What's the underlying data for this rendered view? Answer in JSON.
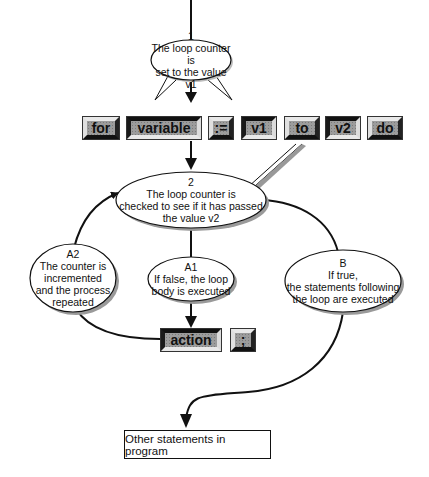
{
  "diagram": {
    "keywords": [
      {
        "id": "for",
        "label": "for",
        "style": "raised"
      },
      {
        "id": "variable",
        "label": "variable",
        "style": "sunken"
      },
      {
        "id": "assign",
        "label": ":=",
        "style": "raised"
      },
      {
        "id": "v1",
        "label": "v1",
        "style": "sunken"
      },
      {
        "id": "to",
        "label": "to",
        "style": "raised"
      },
      {
        "id": "v2",
        "label": "v2",
        "style": "sunken"
      },
      {
        "id": "do",
        "label": "do",
        "style": "raised"
      }
    ],
    "body_keywords": [
      {
        "id": "action",
        "label": "action",
        "style": "sunken"
      },
      {
        "id": "semicolon",
        "label": ";",
        "style": "raised"
      }
    ],
    "bubbles": {
      "step1": {
        "label": "1",
        "text": "The loop counter is\nset to the value v1"
      },
      "step2": {
        "label": "2",
        "text": "The loop counter is\nchecked to see if it has passed\nthe value v2"
      },
      "a1": {
        "label": "A1",
        "text": "If false, the loop\nbody is executed"
      },
      "a2": {
        "label": "A2",
        "text": "The counter is\nincremented\nand the process\nrepeated"
      },
      "b": {
        "label": "B",
        "text": "If true,\nthe statements following\nthe loop are executed"
      }
    },
    "terminal_box": "Other statements in program",
    "colors": {
      "line": "#111111",
      "keyword_fill": "#9c9c9c",
      "bubble_fill": "#ffffff",
      "shadow": "#9a9a9a"
    }
  }
}
